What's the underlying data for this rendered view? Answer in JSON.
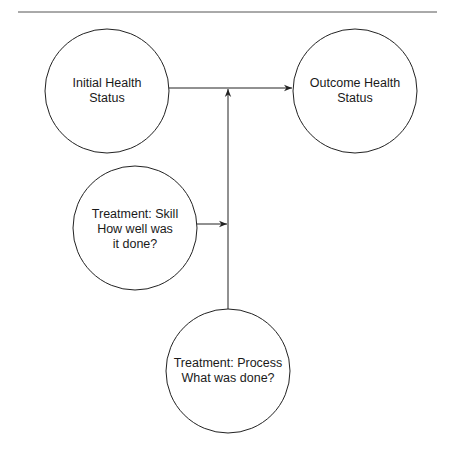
{
  "diagram": {
    "type": "causal-flow",
    "top_rule": {
      "x1": 18,
      "x2": 437,
      "y": 12,
      "color": "#555555"
    },
    "stroke_color": "#222222",
    "nodes": [
      {
        "id": "initial",
        "label": "Initial Health\nStatus",
        "cx": 107,
        "cy": 91,
        "r": 62
      },
      {
        "id": "outcome",
        "label": "Outcome Health\nStatus",
        "cx": 355,
        "cy": 91,
        "r": 62
      },
      {
        "id": "skill",
        "label": "Treatment: Skill\nHow well was\nit done?",
        "cx": 135,
        "cy": 228,
        "r": 62
      },
      {
        "id": "process",
        "label": "Treatment: Process\nWhat was done?",
        "cx": 228,
        "cy": 371,
        "r": 62
      }
    ],
    "edges": [
      {
        "from": "initial",
        "to": "outcome",
        "note": "horizontal arrow y=88"
      },
      {
        "from": "process",
        "to": "initial-outcome-edge",
        "note": "vertical arrow x=228 up to y=88"
      },
      {
        "from": "skill",
        "to": "process-edge",
        "note": "horizontal arrow y=224 into vertical line"
      }
    ]
  }
}
